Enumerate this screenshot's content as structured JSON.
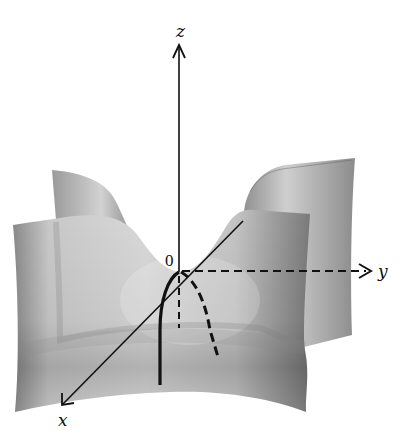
{
  "figure": {
    "type": "3D surface diagram (saddle-like surface with coordinate axes)",
    "axes": {
      "x_label": "x",
      "y_label": "y",
      "z_label": "z",
      "origin_label": "0"
    },
    "curves": [
      {
        "name": "solid-curve",
        "style": "solid",
        "description": "cross-section curve in xz-plane through origin"
      },
      {
        "name": "dashed-curve",
        "style": "dashed",
        "description": "cross-section curve behind origin"
      },
      {
        "name": "dashed-vertical",
        "style": "dashed",
        "description": "negative z-axis segment below origin"
      }
    ],
    "colors": {
      "surface_light": "#e6e6e6",
      "surface_mid": "#b4b4b4",
      "surface_dark": "#6e6e6e",
      "line": "#111111",
      "background": "#ffffff"
    }
  }
}
